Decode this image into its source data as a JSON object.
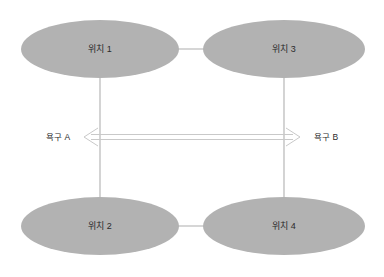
{
  "diagram": {
    "type": "node-link-diagram",
    "background_color": "#ffffff",
    "node_fill_color": "#b2b2b2",
    "connector_color": "#c9c9c9",
    "text_color": "#2b2b2b",
    "nodes": [
      {
        "id": "node-1",
        "label": "위치 1",
        "cx": 100,
        "cy": 49,
        "rx": 79,
        "ry": 29
      },
      {
        "id": "node-3",
        "label": "위치 3",
        "cx": 284,
        "cy": 49,
        "rx": 81,
        "ry": 29
      },
      {
        "id": "node-2",
        "label": "위치 2",
        "cx": 100,
        "cy": 226,
        "rx": 79,
        "ry": 29
      },
      {
        "id": "node-4",
        "label": "위치 4",
        "cx": 284,
        "cy": 226,
        "rx": 81,
        "ry": 29
      }
    ],
    "connectors": [
      {
        "id": "edge-top",
        "from": "node-1",
        "to": "node-3"
      },
      {
        "id": "edge-bottom",
        "from": "node-2",
        "to": "node-4"
      },
      {
        "id": "edge-left",
        "from": "node-1",
        "to": "node-2"
      },
      {
        "id": "edge-right",
        "from": "node-3",
        "to": "node-4"
      }
    ],
    "arrow": {
      "id": "bidirectional-arrow",
      "style": "double-line-open-head",
      "direction": "both",
      "left_label": "욕구 A",
      "right_label": "욕구 B",
      "y": 137
    }
  }
}
